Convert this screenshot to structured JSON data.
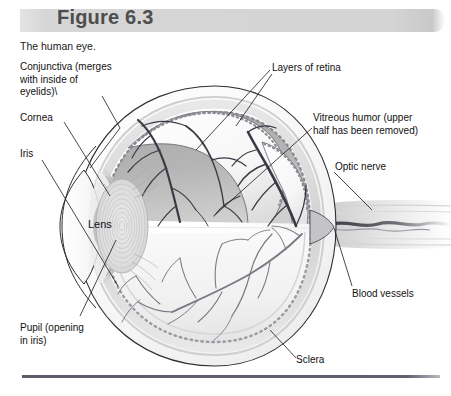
{
  "figure": {
    "number_label": "Figure 6.3",
    "caption": "The human eye."
  },
  "labels": {
    "conjunctiva": "Conjunctiva (merges\nwith inside of\neyelids)\\",
    "cornea": "Cornea",
    "iris": "Iris",
    "lens": "Lens",
    "pupil": "Pupil (opening\nin iris)",
    "layers_of_retina": "Layers of retina",
    "vitreous_humor": "Vitreous humor (upper\nhalf has been removed)",
    "optic_nerve": "Optic nerve",
    "blood_vessels": "Blood vessels",
    "sclera": "Sclera"
  },
  "colors": {
    "banner": "#d6d6d6",
    "banner_text": "#4d4d4d",
    "label_text": "#111111",
    "rule": "#5c5c6a",
    "sclera_outer": "#fdfdfd",
    "sclera_shade": "#e9e9e9",
    "choroid_band": "#d9d9d9",
    "retina_dots": "#9a9aa0",
    "vitreous_upper": "#b3b3b3",
    "vitreous_lower": "#f2f2f2",
    "vessels": "#3a3a42",
    "lens_rings": "#c8c8c8",
    "optic_nerve": "#e3e3e3"
  },
  "diagram": {
    "type": "anatomical-cutaway",
    "subject": "human eye",
    "structures": [
      "sclera",
      "cornea",
      "iris",
      "pupil",
      "lens",
      "conjunctiva",
      "layers of retina",
      "vitreous humor",
      "optic nerve",
      "blood vessels"
    ]
  }
}
